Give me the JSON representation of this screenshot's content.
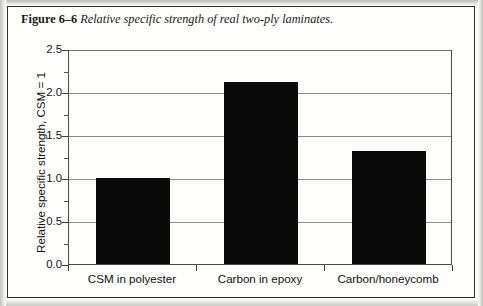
{
  "caption": {
    "label": "Figure 6–6",
    "text": "Relative specific strength of real two-ply laminates."
  },
  "chart_data": {
    "type": "bar",
    "title": "",
    "subtitle": "",
    "xlabel": "",
    "ylabel": "Relative specific strength, CSM = 1",
    "categories": [
      "CSM in polyester",
      "Carbon in epoxy",
      "Carbon/honeycomb"
    ],
    "values": [
      1.0,
      2.12,
      1.31
    ],
    "series": [
      {
        "name": "Relative specific strength",
        "values": [
          1.0,
          2.12,
          1.31
        ],
        "color": "#0a0a0a"
      }
    ],
    "ylim": [
      0.0,
      2.5
    ],
    "ytick_labels": [
      "0.0",
      "0.5",
      "1.0",
      "1.5",
      "2.0",
      "2.5"
    ],
    "ytick_values": [
      0.0,
      0.5,
      1.0,
      1.5,
      2.0,
      2.5
    ],
    "yminor_tick_values": [
      0.25,
      0.75,
      1.25,
      1.75,
      2.25
    ],
    "grid": true,
    "grid_axis": "y",
    "legend": false,
    "legend_position": "none",
    "bar_color": "#0a0a0a",
    "annotations": []
  }
}
